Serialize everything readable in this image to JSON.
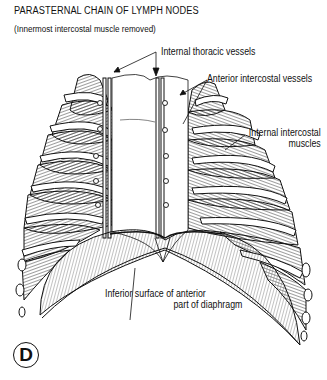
{
  "figure": {
    "title": "PARASTERNAL CHAIN OF LYMPH NODES",
    "subtitle": "(Innermost intercostal muscle removed)",
    "panel_letter": "D"
  },
  "labels": {
    "internal_thoracic_vessels": "Internal thoracic vessels",
    "anterior_intercostal_vessels": "Anterior intercostal vessels",
    "internal_intercostal_muscles_line1": "Internal intercostal",
    "internal_intercostal_muscles_line2": "muscles",
    "diaphragm_line1": "Inferior surface of anterior",
    "diaphragm_line2": "part of diaphragm"
  },
  "colors": {
    "ink": "#111111",
    "background": "#ffffff"
  }
}
